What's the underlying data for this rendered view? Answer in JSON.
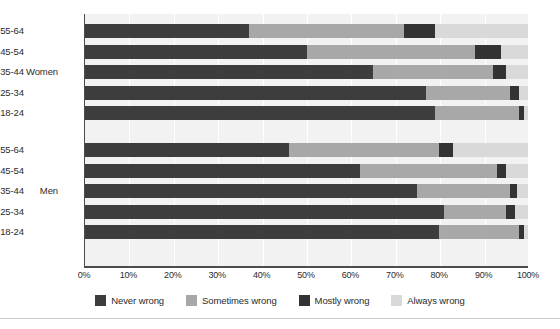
{
  "chart_data": {
    "type": "bar",
    "orientation": "horizontal",
    "stacked": true,
    "stacked_percent": true,
    "title": "",
    "subtitle": "",
    "xlabel": "",
    "ylabel": "",
    "xlim": [
      0,
      100
    ],
    "grid": true,
    "legend_position": "bottom",
    "x_ticks": [
      "0%",
      "10%",
      "20%",
      "30%",
      "40%",
      "50%",
      "60%",
      "70%",
      "80%",
      "90%",
      "100%"
    ],
    "x_tick_values": [
      0,
      10,
      20,
      30,
      40,
      50,
      60,
      70,
      80,
      90,
      100
    ],
    "legend": [
      "Never wrong",
      "Sometimes wrong",
      "Mostly wrong",
      "Always wrong"
    ],
    "colors": {
      "never_wrong": "#3d3d3d",
      "sometimes_wrong": "#a8a8a8",
      "mostly_wrong": "#333333",
      "always_wrong": "#d9d9d9",
      "plot_background": "#f2f2f2",
      "axis": "#4c4c4c",
      "text": "#2b2b2b"
    },
    "groups": [
      {
        "name": "Women",
        "categories": [
          "55-64",
          "45-54",
          "35-44",
          "25-34",
          "18-24"
        ],
        "rows": [
          {
            "category": "55-64",
            "never_wrong": 37,
            "sometimes_wrong": 35,
            "mostly_wrong": 7,
            "always_wrong": 21
          },
          {
            "category": "45-54",
            "never_wrong": 50,
            "sometimes_wrong": 38,
            "mostly_wrong": 6,
            "always_wrong": 6
          },
          {
            "category": "35-44",
            "never_wrong": 65,
            "sometimes_wrong": 27,
            "mostly_wrong": 3,
            "always_wrong": 5
          },
          {
            "category": "25-34",
            "never_wrong": 77,
            "sometimes_wrong": 19,
            "mostly_wrong": 2,
            "always_wrong": 2
          },
          {
            "category": "18-24",
            "never_wrong": 79,
            "sometimes_wrong": 19,
            "mostly_wrong": 1,
            "always_wrong": 1
          }
        ]
      },
      {
        "name": "Men",
        "categories": [
          "55-64",
          "45-54",
          "35-44",
          "25-34",
          "18-24"
        ],
        "rows": [
          {
            "category": "55-64",
            "never_wrong": 46,
            "sometimes_wrong": 34,
            "mostly_wrong": 3,
            "always_wrong": 17
          },
          {
            "category": "45-54",
            "never_wrong": 62,
            "sometimes_wrong": 31,
            "mostly_wrong": 2,
            "always_wrong": 5
          },
          {
            "category": "35-44",
            "never_wrong": 75,
            "sometimes_wrong": 21,
            "mostly_wrong": 1.5,
            "always_wrong": 2.5
          },
          {
            "category": "25-34",
            "never_wrong": 81,
            "sometimes_wrong": 14,
            "mostly_wrong": 2,
            "always_wrong": 3
          },
          {
            "category": "18-24",
            "never_wrong": 80,
            "sometimes_wrong": 18,
            "mostly_wrong": 1,
            "always_wrong": 1
          }
        ]
      }
    ]
  },
  "axis": {
    "ticks": [
      {
        "label": "0%"
      },
      {
        "label": "10%"
      },
      {
        "label": "20%"
      },
      {
        "label": "30%"
      },
      {
        "label": "40%"
      },
      {
        "label": "50%"
      },
      {
        "label": "60%"
      },
      {
        "label": "70%"
      },
      {
        "label": "80%"
      },
      {
        "label": "90%"
      },
      {
        "label": "100%"
      }
    ]
  },
  "legend": {
    "items": [
      {
        "label": "Never wrong",
        "color": "#3d3d3d"
      },
      {
        "label": "Sometimes wrong",
        "color": "#a8a8a8"
      },
      {
        "label": "Mostly wrong",
        "color": "#333333"
      },
      {
        "label": "Always wrong",
        "color": "#d9d9d9"
      }
    ]
  }
}
